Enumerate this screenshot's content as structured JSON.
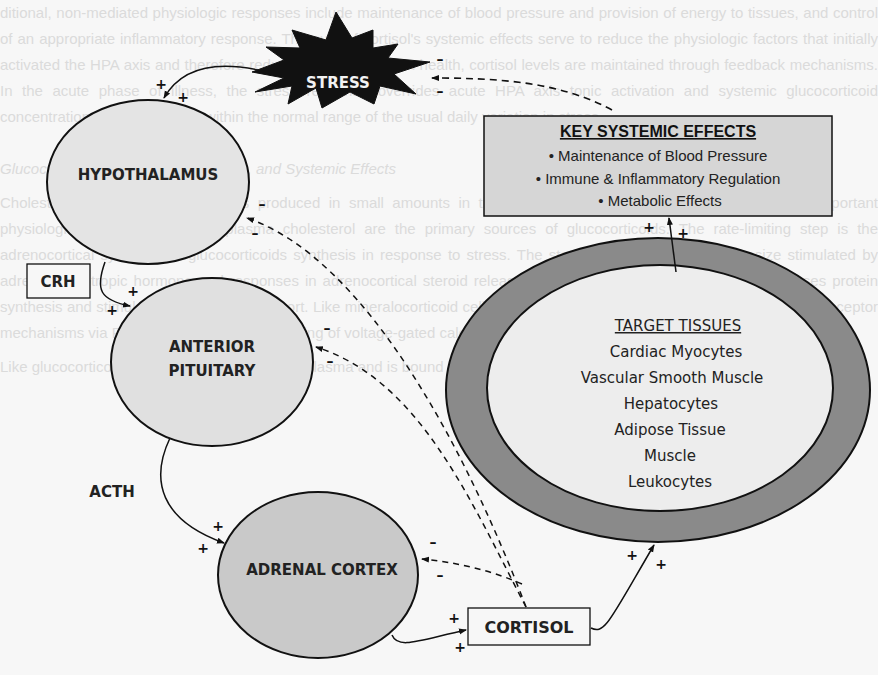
{
  "background_bleed_text": [
    "ditional, non-mediated physiologic responses include maintenance of blood pressure and provision of energy to tissues, and control of an appropriate inflammatory response. The sum of cortisol's systemic effects serve to reduce the physiologic factors that initially activated the HPA axis and therefore reduce HPA axis tone. In health, cortisol levels are maintained through feedback mechanisms. In the acute phase of illness, the stress response overrides acute HPA axis tonic activation and systemic glucocorticoid concentrations are maintained within the normal range of the usual daily variation in stress.",
    "Glucocorticoids: Synthesis, Secretion, and Systemic Effects",
    "Cholesterol is the precursor and is produced in small amounts in the adrenal cortex. Adrenocortical synthesis of important physiologic glucocorticoids and plasma cholesterol are the primary sources of glucocorticoids. The rate-limiting step is the adrenocortical synthesis of glucocorticoids synthesis in response to stress. The steroidogenic enzymes synthesize stimulated by adrenocorticotropic hormone and responses in adrenocortical steroid release. A hormone-mediated mechanism increases protein synthesis and stimulates cholesterol transport. Like mineralocorticoid cellular calcium signaling as a response element II by receptor mechanisms via PKA and potassium via opening of voltage-gated calcium channels.",
    "Like glucocorticoids, aldosterone circulates in plasma and is bound to albumin or CBG."
  ],
  "stress": {
    "label": "STRESS"
  },
  "organs": {
    "hypothalamus": "HYPOTHALAMUS",
    "anterior_pituitary_line1": "ANTERIOR",
    "anterior_pituitary_line2": "PITUITARY",
    "adrenal_cortex": "ADRENAL CORTEX"
  },
  "hormones": {
    "crh": "CRH",
    "acth": "ACTH",
    "cortisol": "CORTISOL"
  },
  "key_systemic_effects": {
    "title": "KEY SYSTEMIC EFFECTS",
    "items": [
      "• Maintenance of Blood Pressure",
      "• Immune & Inflammatory Regulation",
      "• Metabolic Effects"
    ]
  },
  "target_tissues": {
    "title": "TARGET TISSUES",
    "items": [
      "Cardiac Myocytes",
      "Vascular Smooth Muscle",
      "Hepatocytes",
      "Adipose Tissue",
      "Muscle",
      "Leukocytes"
    ]
  },
  "signs": {
    "plus": "+",
    "minus": "–"
  },
  "colors": {
    "hypothalamus_fill": "#e4e4e4",
    "pituitary_fill": "#e0e0e0",
    "adrenal_fill": "#c9c9c9",
    "key_box_fill": "#d6d6d6",
    "tissue_ring_fill": "#8a8a8a",
    "tissue_inner_fill": "#ededed",
    "stress_fill": "#111111",
    "stroke": "#111111"
  }
}
